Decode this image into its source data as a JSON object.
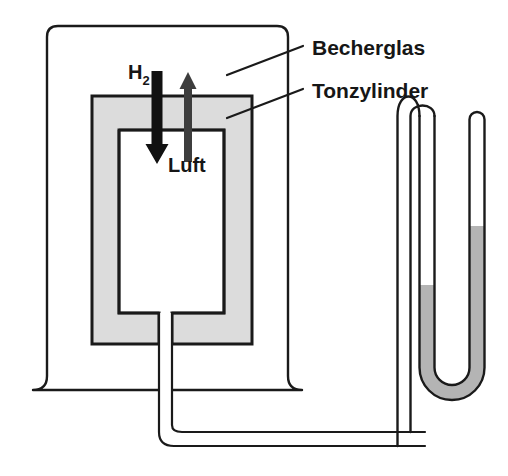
{
  "figure": {
    "background_color": "#ffffff",
    "stroke_color": "#1a1a1a",
    "porous_fill_color": "#dcdcdc",
    "liquid_color": "#b4b4b4",
    "arrow_down_color": "#111111",
    "arrow_up_color": "#3d3d3d"
  },
  "callouts": [
    {
      "id": "becherglas",
      "label": "Becherglas",
      "text_x": 312,
      "text_y": 55,
      "leader": "M 227 75 L 303 46"
    },
    {
      "id": "tonzylinder",
      "label": "Tonzylinder",
      "text_x": 312,
      "text_y": 98,
      "leader": "M 227 118 L 303 89"
    }
  ],
  "inline_labels": [
    {
      "id": "hydrogen",
      "base": "H",
      "subscript": "2",
      "x": 128,
      "y": 79
    },
    {
      "id": "air",
      "base": "Luft",
      "subscript": "",
      "x": 168,
      "y": 172
    }
  ],
  "components": {
    "beaker": {
      "name": "Becherglas",
      "left": 47,
      "right": 288,
      "top": 26,
      "bottom": 390,
      "corner_radius": 11,
      "stroke_width": 2.4,
      "flare": 14
    },
    "clay_cylinder": {
      "name": "Tonzylinder",
      "left": 92,
      "right": 252,
      "top": 96,
      "bottom": 344,
      "stroke_width": 3.0,
      "fill": "#dcdcdc"
    },
    "inner_chamber": {
      "name": "Luftraum",
      "left": 119,
      "right": 224,
      "top": 130,
      "bottom": 313,
      "stroke_width": 2.6,
      "fill": "#ffffff"
    },
    "hydrogen_arrow": {
      "direction": "down",
      "x": 157,
      "top": 71,
      "bottom": 164,
      "shaft_width": 11,
      "head_width": 23,
      "head_height": 20,
      "color": "#111111"
    },
    "air_arrow": {
      "direction": "up",
      "x": 188,
      "top": 72,
      "bottom": 162,
      "shaft_width": 8,
      "head_width": 17,
      "head_height": 17,
      "color": "#3d3d3d"
    },
    "connecting_tube": {
      "name": "Verbindungsschlauch",
      "inner_width": 12,
      "stroke_width": 2.2,
      "path_outer": "M 159 313 L 159 432 Q 159 446 174 446 L 425 446",
      "path_inner": "M 172 313 L 172 425 Q 172 432 182 432 L 425 432"
    },
    "manometer": {
      "name": "U-Rohr-Manometer",
      "left_arm_x": 427,
      "right_arm_x": 477,
      "tube_width": 15,
      "top_left": 116,
      "top_right": 112,
      "bottom": 400,
      "stroke_width": 2.4,
      "liquid_level_left": 285,
      "liquid_level_right": 226,
      "liquid_color": "#b4b4b4"
    }
  }
}
